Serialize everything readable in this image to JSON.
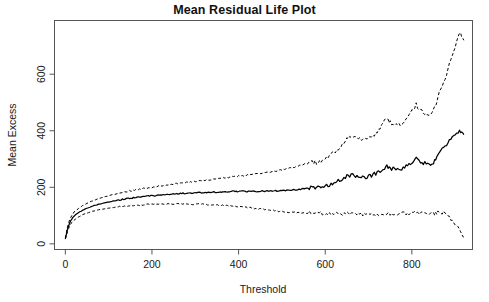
{
  "chart_data": {
    "type": "line",
    "title": "Mean Residual Life Plot",
    "xlabel": "Threshold",
    "ylabel": "Mean Excess",
    "xlim": [
      -25,
      940
    ],
    "ylim": [
      -20,
      790
    ],
    "xticks": [
      0,
      200,
      400,
      600,
      800
    ],
    "yticks": [
      0,
      200,
      400,
      600
    ],
    "grid": false,
    "legend": null,
    "series": [
      {
        "name": "Upper 95% confidence limit",
        "style": "dashed",
        "color": "#000000",
        "x": [
          0,
          5,
          10,
          15,
          20,
          30,
          40,
          50,
          60,
          70,
          80,
          90,
          100,
          120,
          140,
          160,
          180,
          200,
          220,
          240,
          260,
          280,
          300,
          320,
          340,
          360,
          380,
          400,
          420,
          440,
          460,
          480,
          500,
          520,
          540,
          560,
          570,
          580,
          590,
          600,
          610,
          620,
          630,
          640,
          650,
          660,
          670,
          680,
          690,
          700,
          710,
          720,
          730,
          740,
          745,
          750,
          760,
          770,
          780,
          790,
          800,
          810,
          820,
          830,
          840,
          850,
          855,
          860,
          870,
          880,
          890,
          900,
          910,
          915,
          920
        ],
        "y": [
          20,
          60,
          85,
          100,
          112,
          125,
          135,
          143,
          150,
          156,
          161,
          166,
          170,
          178,
          184,
          190,
          196,
          200,
          205,
          209,
          213,
          217,
          221,
          224,
          228,
          232,
          236,
          240,
          243,
          247,
          251,
          256,
          262,
          268,
          276,
          285,
          290,
          288,
          292,
          300,
          310,
          322,
          336,
          352,
          370,
          382,
          378,
          372,
          368,
          372,
          382,
          398,
          418,
          440,
          436,
          430,
          424,
          420,
          430,
          448,
          470,
          492,
          470,
          462,
          458,
          470,
          492,
          520,
          556,
          600,
          650,
          700,
          745,
          735,
          720
        ]
      },
      {
        "name": "Mean excess (empirical)",
        "style": "solid",
        "color": "#000000",
        "x": [
          0,
          5,
          10,
          15,
          20,
          30,
          40,
          50,
          60,
          70,
          80,
          90,
          100,
          120,
          140,
          160,
          180,
          200,
          220,
          240,
          260,
          280,
          300,
          320,
          340,
          360,
          380,
          400,
          420,
          440,
          460,
          480,
          500,
          520,
          540,
          560,
          570,
          580,
          590,
          600,
          610,
          620,
          630,
          640,
          650,
          660,
          670,
          680,
          690,
          700,
          710,
          720,
          730,
          740,
          745,
          750,
          760,
          770,
          780,
          790,
          800,
          810,
          820,
          830,
          840,
          850,
          855,
          860,
          870,
          880,
          890,
          900,
          910,
          915,
          920
        ],
        "y": [
          18,
          52,
          74,
          88,
          98,
          110,
          119,
          126,
          132,
          137,
          141,
          145,
          148,
          154,
          159,
          163,
          167,
          170,
          173,
          175,
          177,
          179,
          181,
          182,
          183,
          184,
          185,
          186,
          186,
          186,
          186,
          187,
          188,
          190,
          193,
          197,
          200,
          198,
          200,
          204,
          209,
          215,
          222,
          230,
          239,
          245,
          242,
          238,
          236,
          238,
          244,
          252,
          262,
          274,
          271,
          268,
          264,
          262,
          268,
          278,
          290,
          302,
          290,
          285,
          282,
          288,
          300,
          316,
          334,
          352,
          368,
          382,
          398,
          392,
          386
        ]
      },
      {
        "name": "Lower 95% confidence limit",
        "style": "dashed",
        "color": "#000000",
        "x": [
          0,
          5,
          10,
          15,
          20,
          30,
          40,
          50,
          60,
          70,
          80,
          90,
          100,
          120,
          140,
          160,
          180,
          200,
          220,
          240,
          260,
          280,
          300,
          320,
          340,
          360,
          380,
          400,
          420,
          440,
          460,
          480,
          500,
          520,
          540,
          560,
          570,
          580,
          590,
          600,
          610,
          620,
          630,
          640,
          650,
          660,
          670,
          680,
          690,
          700,
          710,
          720,
          730,
          740,
          745,
          750,
          760,
          770,
          780,
          790,
          800,
          810,
          820,
          830,
          840,
          850,
          855,
          860,
          870,
          880,
          890,
          900,
          910,
          915,
          920
        ],
        "y": [
          16,
          44,
          63,
          76,
          84,
          95,
          103,
          109,
          114,
          118,
          121,
          124,
          126,
          130,
          134,
          136,
          138,
          140,
          141,
          141,
          141,
          141,
          140,
          140,
          138,
          136,
          134,
          132,
          129,
          125,
          121,
          118,
          114,
          112,
          110,
          109,
          110,
          108,
          108,
          108,
          108,
          108,
          108,
          108,
          108,
          108,
          106,
          104,
          104,
          104,
          106,
          106,
          106,
          108,
          106,
          106,
          104,
          104,
          106,
          108,
          110,
          112,
          110,
          108,
          106,
          106,
          108,
          112,
          112,
          104,
          86,
          64,
          50,
          36,
          24
        ]
      }
    ]
  }
}
